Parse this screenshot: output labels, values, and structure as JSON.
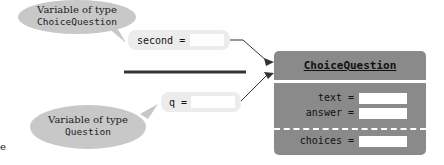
{
  "callouts": {
    "top": {
      "line1": "Variable of type",
      "line2": "ChoiceQuestion"
    },
    "bottom": {
      "line1": "Variable of type",
      "line2": "Question"
    }
  },
  "variables": {
    "second": {
      "label": "second ="
    },
    "q": {
      "label": "q ="
    }
  },
  "object": {
    "class_name": "ChoiceQuestion",
    "fields": [
      {
        "label": "text ="
      },
      {
        "label": "answer ="
      }
    ],
    "subclass_fields": [
      {
        "label": "choices ="
      }
    ]
  },
  "edge_fragment": "e",
  "colors": {
    "bubble": "#c8c8c8",
    "object": "#8a8a8a",
    "variable_bg": "#ececec"
  }
}
